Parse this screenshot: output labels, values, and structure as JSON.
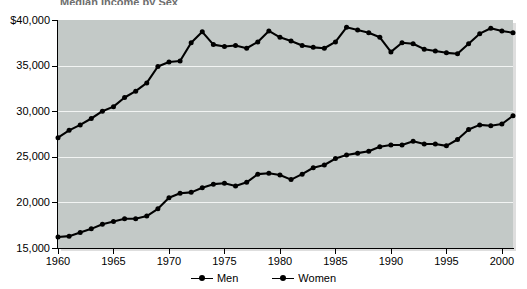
{
  "title_sliver": "Median Income by Sex",
  "chart_data": {
    "type": "line",
    "title": "Median Income by Sex",
    "xlabel": "",
    "ylabel": "",
    "xlim": [
      1960,
      2001
    ],
    "ylim": [
      15000,
      40000
    ],
    "grid": true,
    "legend_position": "bottom-center",
    "x_tick_labels": [
      "1960",
      "1965",
      "1970",
      "1975",
      "1980",
      "1985",
      "1990",
      "1995",
      "2000"
    ],
    "x_ticks": [
      1960,
      1965,
      1970,
      1975,
      1980,
      1985,
      1990,
      1995,
      2000
    ],
    "y_tick_labels": [
      "$40,000",
      "35,000",
      "30,000",
      "25,000",
      "20,000",
      "15,000"
    ],
    "y_ticks": [
      40000,
      35000,
      30000,
      25000,
      20000,
      15000
    ],
    "x": [
      1960,
      1961,
      1962,
      1963,
      1964,
      1965,
      1966,
      1967,
      1968,
      1969,
      1970,
      1971,
      1972,
      1973,
      1974,
      1975,
      1976,
      1977,
      1978,
      1979,
      1980,
      1981,
      1982,
      1983,
      1984,
      1985,
      1986,
      1987,
      1988,
      1989,
      1990,
      1991,
      1992,
      1993,
      1994,
      1995,
      1996,
      1997,
      1998,
      1999,
      2000,
      2001
    ],
    "series": [
      {
        "name": "Men",
        "color": "#000000",
        "values": [
          27100,
          27900,
          28500,
          29200,
          30000,
          30500,
          31500,
          32200,
          33100,
          34900,
          35400,
          35500,
          37500,
          38700,
          37300,
          37100,
          37200,
          36900,
          37600,
          38800,
          38100,
          37700,
          37200,
          37000,
          36900,
          37600,
          39200,
          38900,
          38600,
          38100,
          36500,
          37500,
          37400,
          36800,
          36600,
          36400,
          36300,
          37400,
          38500,
          39100,
          38800,
          38600
        ]
      },
      {
        "name": "Women",
        "color": "#000000",
        "values": [
          16200,
          16300,
          16700,
          17100,
          17600,
          17900,
          18200,
          18200,
          18500,
          19300,
          20500,
          21000,
          21100,
          21600,
          22000,
          22100,
          21800,
          22200,
          23100,
          23200,
          23000,
          22500,
          23100,
          23800,
          24100,
          24800,
          25200,
          25400,
          25600,
          26100,
          26300,
          26300,
          26700,
          26400,
          26400,
          26200,
          26900,
          28000,
          28500,
          28400,
          28600,
          29500
        ]
      }
    ]
  },
  "legend": {
    "items": [
      {
        "label": "Men"
      },
      {
        "label": "Women"
      }
    ]
  }
}
